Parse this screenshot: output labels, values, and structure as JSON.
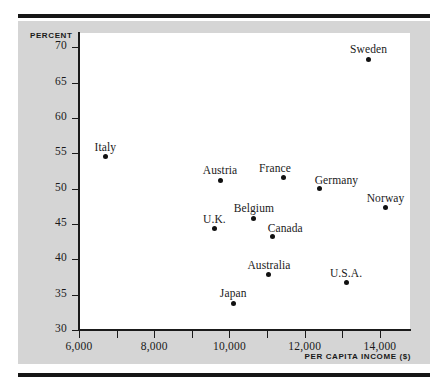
{
  "chart_data": {
    "type": "scatter",
    "title": "",
    "xlabel": "PER CAPITA INCOME ($)",
    "ylabel": "PERCENT",
    "xlim": [
      6000,
      14800
    ],
    "ylim": [
      30,
      72
    ],
    "grid": false,
    "legend": "none",
    "x_tick_labels": [
      "6,000",
      "8,000",
      "10,000",
      "12,000",
      "14,000"
    ],
    "x_tick_values": [
      6000,
      8000,
      10000,
      12000,
      14000
    ],
    "x_minor_tick_values": [
      6000,
      7000,
      8000,
      9000,
      10000,
      11000,
      12000,
      13000,
      14000
    ],
    "y_tick_labels": [
      "30",
      "35",
      "40",
      "45",
      "50",
      "55",
      "60",
      "65",
      "70"
    ],
    "y_tick_values": [
      30,
      35,
      40,
      45,
      50,
      55,
      60,
      65,
      70
    ],
    "points": [
      {
        "label": "Italy",
        "x": 6700,
        "y": 54.5,
        "label_pos": "above"
      },
      {
        "label": "U.K.",
        "x": 9600,
        "y": 44.3,
        "label_pos": "above"
      },
      {
        "label": "Austria",
        "x": 9750,
        "y": 51.2,
        "label_pos": "above"
      },
      {
        "label": "Japan",
        "x": 10100,
        "y": 33.8,
        "label_pos": "above"
      },
      {
        "label": "Belgium",
        "x": 10650,
        "y": 45.8,
        "label_pos": "above"
      },
      {
        "label": "Australia",
        "x": 11050,
        "y": 37.8,
        "label_pos": "above"
      },
      {
        "label": "Canada",
        "x": 11150,
        "y": 43.2,
        "label_pos": "above-right"
      },
      {
        "label": "France",
        "x": 11450,
        "y": 51.6,
        "label_pos": "above-left"
      },
      {
        "label": "Germany",
        "x": 12400,
        "y": 50.0,
        "label_pos": "above-right"
      },
      {
        "label": "U.S.A.",
        "x": 13100,
        "y": 36.7,
        "label_pos": "above"
      },
      {
        "label": "Sweden",
        "x": 13700,
        "y": 68.3,
        "label_pos": "above"
      },
      {
        "label": "Norway",
        "x": 14150,
        "y": 47.3,
        "label_pos": "above"
      }
    ]
  },
  "colors": {
    "panel_background": "#d5d5d5",
    "plot_background": "#ffffff",
    "rule": "#161616",
    "axis": "#1a1a1a",
    "marker": "#111111",
    "text": "#1a1a1a"
  }
}
